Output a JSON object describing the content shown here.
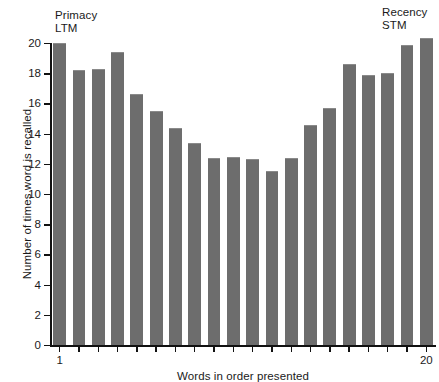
{
  "chart_data": {
    "type": "bar",
    "title": "",
    "xlabel": "Words in order presented",
    "ylabel": "Number of times word is recalled",
    "categories": [
      "1",
      "2",
      "3",
      "4",
      "5",
      "6",
      "7",
      "8",
      "9",
      "10",
      "11",
      "12",
      "13",
      "14",
      "15",
      "16",
      "17",
      "18",
      "19",
      "20"
    ],
    "values": [
      20.0,
      18.2,
      18.3,
      19.4,
      16.6,
      15.5,
      14.4,
      13.4,
      12.4,
      12.45,
      12.3,
      11.5,
      12.4,
      14.6,
      15.7,
      18.6,
      17.9,
      18.0,
      19.9,
      20.3
    ],
    "ylim": [
      0,
      20
    ],
    "yticks": [
      0,
      2,
      4,
      6,
      8,
      10,
      12,
      14,
      16,
      18,
      20
    ],
    "ytick_labels": [
      "0",
      "2",
      "4",
      "6",
      "8",
      "10",
      "12",
      "14",
      "16",
      "18",
      "20"
    ],
    "xtick_labels_shown": {
      "first": "1",
      "last": "20"
    },
    "grid": false,
    "legend": false,
    "bar_color": "#6d6d6d",
    "axis_color": "#111111",
    "annotations": [
      {
        "id": "primacy",
        "text": "Primacy\nLTM",
        "position": "top-left"
      },
      {
        "id": "recency",
        "text": "Recency\nSTM",
        "position": "top-right"
      }
    ]
  }
}
